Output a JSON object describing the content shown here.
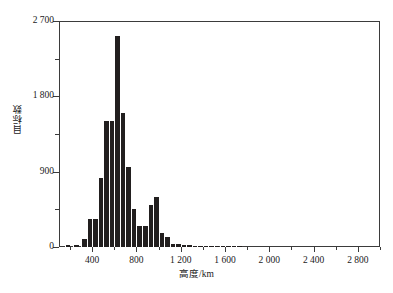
{
  "chart_data": {
    "type": "bar",
    "title": "",
    "subtitle": "",
    "xlabel": "高度/km",
    "ylabel": "目标数",
    "xlim": [
      100,
      3000
    ],
    "ylim": [
      0,
      2700
    ],
    "grid": false,
    "legend": null,
    "bin_width": 50,
    "y_ticks": [
      0,
      900,
      1800,
      2700
    ],
    "y_tick_labels": [
      "0",
      "900",
      "1 800",
      "2 700"
    ],
    "y_minor_ticks": [
      450,
      1350,
      2250
    ],
    "x_ticks": [
      400,
      800,
      1200,
      1600,
      2000,
      2400,
      2800
    ],
    "x_tick_labels": [
      "400",
      "800",
      "1 200",
      "1 600",
      "2 000",
      "2 400",
      "2 800"
    ],
    "x_minor_ticks": [
      200,
      600,
      1000,
      1400,
      1800,
      2200,
      2600,
      3000
    ],
    "bar_color": "#221f1f",
    "axis_color": "#3b3b3b",
    "background_color": "#ffffff",
    "categories": [
      "100-150",
      "150-200",
      "200-250",
      "250-300",
      "300-350",
      "350-400",
      "400-450",
      "450-500",
      "500-550",
      "550-600",
      "600-650",
      "650-700",
      "700-750",
      "750-800",
      "800-850",
      "850-900",
      "900-950",
      "950-1000",
      "1000-1050",
      "1050-1100",
      "1100-1150",
      "1150-1200",
      "1200-1250",
      "1250-1300",
      "1300-1350",
      "1350-1400",
      "1400-1450",
      "1450-1500",
      "1500-1550",
      "1550-1600",
      "1600-1650",
      "1650-1700",
      "1700-1750",
      "1750-1800",
      "1800-1850",
      "1850-1900",
      "1900-1950",
      "1950-2000",
      "2000-2050",
      "2050-2100",
      "2100-2150",
      "2150-2200",
      "2200-2250",
      "2250-2300",
      "2300-2350",
      "2350-2400",
      "2400-2450",
      "2450-2500",
      "2500-2550",
      "2550-2600",
      "2600-2650",
      "2650-2700",
      "2700-2750",
      "2750-2800",
      "2800-2850",
      "2850-2900",
      "2900-2950",
      "2950-3000"
    ],
    "values": [
      0,
      20,
      20,
      30,
      30,
      90,
      0,
      0,
      330,
      0,
      820,
      0,
      1500,
      0,
      2520,
      1600,
      0,
      950,
      0,
      0,
      0,
      460,
      0,
      250,
      250,
      0,
      500,
      0,
      600,
      0,
      0,
      170,
      0,
      120,
      0,
      40,
      30,
      0,
      35,
      0,
      30,
      0,
      10,
      0,
      8,
      0,
      6,
      0,
      5,
      0,
      4,
      0,
      3,
      0,
      3,
      0,
      6,
      0
    ],
    "bars": [
      {
        "x0": 150,
        "x1": 200,
        "value": 20
      },
      {
        "x0": 230,
        "x1": 280,
        "value": 25
      },
      {
        "x0": 300,
        "x1": 350,
        "value": 95
      },
      {
        "x0": 350,
        "x1": 400,
        "value": 330
      },
      {
        "x0": 400,
        "x1": 450,
        "value": 330
      },
      {
        "x0": 450,
        "x1": 500,
        "value": 820
      },
      {
        "x0": 500,
        "x1": 550,
        "value": 1500
      },
      {
        "x0": 550,
        "x1": 600,
        "value": 1500
      },
      {
        "x0": 600,
        "x1": 650,
        "value": 2520
      },
      {
        "x0": 650,
        "x1": 700,
        "value": 1600
      },
      {
        "x0": 700,
        "x1": 750,
        "value": 950
      },
      {
        "x0": 750,
        "x1": 800,
        "value": 460
      },
      {
        "x0": 800,
        "x1": 850,
        "value": 250
      },
      {
        "x0": 850,
        "x1": 900,
        "value": 250
      },
      {
        "x0": 900,
        "x1": 950,
        "value": 500
      },
      {
        "x0": 950,
        "x1": 1000,
        "value": 600
      },
      {
        "x0": 1000,
        "x1": 1050,
        "value": 170
      },
      {
        "x0": 1050,
        "x1": 1100,
        "value": 120
      },
      {
        "x0": 1100,
        "x1": 1150,
        "value": 40
      },
      {
        "x0": 1150,
        "x1": 1200,
        "value": 35
      },
      {
        "x0": 1200,
        "x1": 1250,
        "value": 30
      },
      {
        "x0": 1250,
        "x1": 1300,
        "value": 28
      },
      {
        "x0": 1300,
        "x1": 1350,
        "value": 10
      },
      {
        "x0": 1350,
        "x1": 1400,
        "value": 8
      },
      {
        "x0": 1400,
        "x1": 1450,
        "value": 6
      },
      {
        "x0": 1450,
        "x1": 1500,
        "value": 5
      },
      {
        "x0": 1500,
        "x1": 1550,
        "value": 4
      },
      {
        "x0": 1550,
        "x1": 1600,
        "value": 4
      },
      {
        "x0": 1600,
        "x1": 1650,
        "value": 3
      },
      {
        "x0": 1650,
        "x1": 1700,
        "value": 3
      },
      {
        "x0": 1700,
        "x1": 1750,
        "value": 6
      }
    ]
  }
}
